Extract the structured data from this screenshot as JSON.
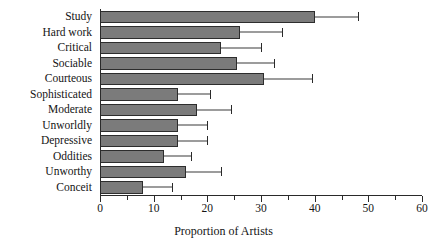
{
  "chart_data": {
    "type": "bar",
    "orientation": "horizontal",
    "title": "",
    "subtitle": "",
    "xlabel": "Proportion of Artists",
    "ylabel": "",
    "xlim": [
      0,
      60
    ],
    "ylim": null,
    "grid": false,
    "legend": null,
    "xticks": [
      0,
      10,
      20,
      30,
      40,
      50,
      60
    ],
    "xtick_labels": [
      "0",
      "10",
      "20",
      "30",
      "40",
      "50",
      "60"
    ],
    "xminor_ticks": [
      5,
      15,
      25,
      35,
      45,
      55
    ],
    "error_bars": "horizontal confidence intervals",
    "categories": [
      "Study",
      "Hard work",
      "Critical",
      "Sociable",
      "Courteous",
      "Sophisticated",
      "Moderate",
      "Unworldly",
      "Depressive",
      "Oddities",
      "Unworthy",
      "Conceit"
    ],
    "values": [
      40.0,
      26.0,
      22.5,
      25.5,
      30.5,
      14.5,
      18.0,
      14.5,
      14.5,
      12.0,
      16.0,
      8.0
    ],
    "err_low": [
      32.0,
      19.5,
      16.0,
      18.0,
      23.5,
      8.0,
      11.5,
      8.5,
      8.5,
      6.5,
      10.0,
      3.0
    ],
    "err_high": [
      48.0,
      34.0,
      30.0,
      32.5,
      39.5,
      20.5,
      24.5,
      20.0,
      20.0,
      17.0,
      22.5,
      13.5
    ],
    "series": [
      {
        "name": "Proportion of Artists",
        "values": [
          40.0,
          26.0,
          22.5,
          25.5,
          30.5,
          14.5,
          18.0,
          14.5,
          14.5,
          12.0,
          16.0,
          8.0
        ]
      }
    ],
    "colors": {
      "bar_fill": "#7b7b7b",
      "bar_edge": "#2d2d2d",
      "error_bar": "#3a3a3a",
      "axis": "#2a2a2a",
      "text": "#141414",
      "background": "#ffffff"
    }
  }
}
